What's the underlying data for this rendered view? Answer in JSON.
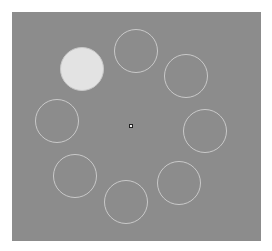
{
  "stage": {
    "background_color": "#8c8c8c",
    "origin": [
      12,
      12
    ],
    "size": [
      249,
      229
    ]
  },
  "colors": {
    "ring_outline": "#c9c9c9",
    "filled_target": "#e3e3e3",
    "fixation_fill": "#f0f0f0",
    "fixation_outline": "#222222"
  },
  "fixation": {
    "center": [
      131,
      126
    ],
    "icon": "fixation-point-icon"
  },
  "targets": [
    {
      "id": "upper-left",
      "center": [
        82,
        69
      ],
      "radius": 22,
      "filled": true
    },
    {
      "id": "top",
      "center": [
        136,
        51
      ],
      "radius": 22,
      "filled": false
    },
    {
      "id": "upper-right",
      "center": [
        186,
        76
      ],
      "radius": 22,
      "filled": false
    },
    {
      "id": "right",
      "center": [
        205,
        131
      ],
      "radius": 22,
      "filled": false
    },
    {
      "id": "lower-right",
      "center": [
        179,
        183
      ],
      "radius": 22,
      "filled": false
    },
    {
      "id": "bottom",
      "center": [
        126,
        202
      ],
      "radius": 22,
      "filled": false
    },
    {
      "id": "lower-left",
      "center": [
        75,
        176
      ],
      "radius": 22,
      "filled": false
    },
    {
      "id": "left",
      "center": [
        57,
        121
      ],
      "radius": 22,
      "filled": false
    }
  ]
}
